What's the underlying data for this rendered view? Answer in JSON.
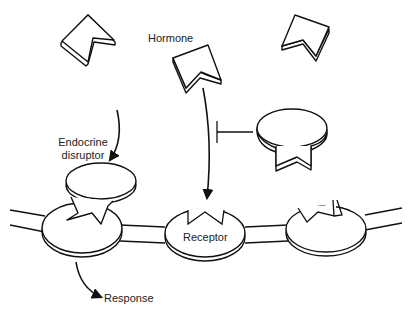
{
  "diagram": {
    "labels": {
      "hormone": "Hormone",
      "endocrine_disruptor_line1": "Endocrine",
      "endocrine_disruptor_line2": "disruptor",
      "receptor": "Receptor",
      "response": "Response"
    },
    "nodes": [
      {
        "id": "hormone-free-left",
        "type": "hormone",
        "label": ""
      },
      {
        "id": "hormone-center",
        "type": "hormone",
        "label": "Hormone"
      },
      {
        "id": "hormone-free-right",
        "type": "hormone",
        "label": ""
      },
      {
        "id": "blocker",
        "type": "antagonist",
        "label": ""
      },
      {
        "id": "endocrine-disruptor",
        "type": "disruptor",
        "label": "Endocrine disruptor"
      },
      {
        "id": "receptor-left",
        "type": "receptor",
        "label": ""
      },
      {
        "id": "receptor-center",
        "type": "receptor",
        "label": "Receptor"
      },
      {
        "id": "receptor-right",
        "type": "receptor",
        "label": ""
      },
      {
        "id": "membrane",
        "type": "membrane",
        "label": ""
      }
    ],
    "edges": [
      {
        "from": "endocrine-disruptor",
        "to": "receptor-left",
        "type": "arrow"
      },
      {
        "from": "hormone-center",
        "to": "receptor-center",
        "type": "arrow"
      },
      {
        "from": "blocker",
        "to": "hormone-center-arrow",
        "type": "inhibition"
      },
      {
        "from": "receptor-left",
        "to": "response",
        "type": "arrow",
        "label": "Response"
      }
    ],
    "colors": {
      "stroke": "#111111",
      "fill": "#ffffff",
      "text": "#222222"
    }
  }
}
